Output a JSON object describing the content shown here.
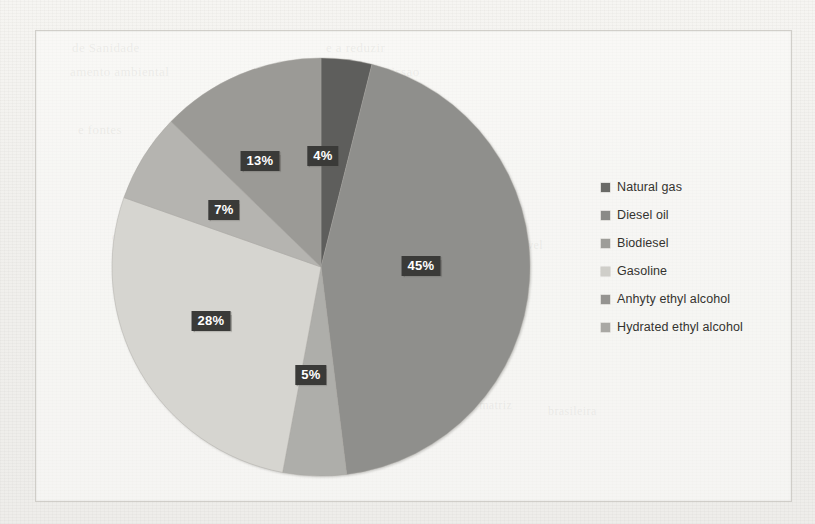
{
  "chart_data": {
    "type": "pie",
    "title": "",
    "categories": [
      "Natural gas",
      "Diesel oil",
      "Anhydrous ethyl alcohol",
      "Gasoline",
      "Biodiesel",
      "Hydrated ethyl alcohol"
    ],
    "values": [
      4,
      45,
      5,
      28,
      7,
      13
    ],
    "value_labels": [
      "4%",
      "45%",
      "5%",
      "28%",
      "7%",
      "13%"
    ],
    "units": "percent",
    "legend_position": "right",
    "start_angle_deg": 0,
    "direction": "clockwise",
    "grid": false,
    "slices": [
      {
        "label": "Natural gas",
        "value": 4,
        "display": "4%",
        "color": "#5e5e5c",
        "order_clockwise": 1
      },
      {
        "label": "Diesel oil",
        "value": 45,
        "display": "45%",
        "color": "#8f8f8c",
        "order_clockwise": 2
      },
      {
        "label": "Anhydrous ethyl alcohol",
        "value": 5,
        "display": "5%",
        "color": "#aeaeaa",
        "order_clockwise": 3
      },
      {
        "label": "Gasoline",
        "value": 28,
        "display": "28%",
        "color": "#d6d5d0",
        "order_clockwise": 4
      },
      {
        "label": "Biodiesel",
        "value": 7,
        "display": "7%",
        "color": "#b5b4b0",
        "order_clockwise": 5
      },
      {
        "label": "Hydrated ethyl alcohol",
        "value": 13,
        "display": "13%",
        "color": "#9b9a96",
        "order_clockwise": 6
      }
    ]
  },
  "legend": {
    "items": [
      {
        "label": "Natural gas",
        "color": "#6a6a67"
      },
      {
        "label": "Diesel oil",
        "color": "#8a8a87"
      },
      {
        "label": "Biodiesel",
        "color": "#9e9d99"
      },
      {
        "label": "Gasoline",
        "color": "#cfcec9"
      },
      {
        "label": "Anhyty ethyl alcohol",
        "color": "#959491"
      },
      {
        "label": "Hydrated ethyl alcohol",
        "color": "#a9a8a4"
      }
    ]
  },
  "labels": [
    {
      "text": "4%",
      "x": 322,
      "y": 155
    },
    {
      "text": "13%",
      "x": 259,
      "y": 160
    },
    {
      "text": "45%",
      "x": 420,
      "y": 265
    },
    {
      "text": "7%",
      "x": 223,
      "y": 209
    },
    {
      "text": "28%",
      "x": 210,
      "y": 320
    },
    {
      "text": "5%",
      "x": 310,
      "y": 374
    }
  ],
  "background_ghost_text": [
    {
      "text": "de Sanidade",
      "x": 72,
      "y": 40,
      "size": 13
    },
    {
      "text": "amento ambiental",
      "x": 70,
      "y": 64,
      "size": 13
    },
    {
      "text": "e a reduzir",
      "x": 326,
      "y": 40,
      "size": 13
    },
    {
      "text": "o ambiente a emissao",
      "x": 300,
      "y": 64,
      "size": 13
    },
    {
      "text": "as emissoes de",
      "x": 330,
      "y": 104,
      "size": 13
    },
    {
      "text": "e fontes",
      "x": 78,
      "y": 122,
      "size": 13
    },
    {
      "text": "a  Brasil",
      "x": 300,
      "y": 130,
      "size": 13
    },
    {
      "text": "de queima",
      "x": 112,
      "y": 230,
      "size": 12
    },
    {
      "text": "combustivel",
      "x": 480,
      "y": 238,
      "size": 12
    },
    {
      "text": "produzido",
      "x": 120,
      "y": 262,
      "size": 12
    },
    {
      "text": "a matriz",
      "x": 470,
      "y": 398,
      "size": 12
    },
    {
      "text": "Figura 2",
      "x": 330,
      "y": 432,
      "size": 13
    },
    {
      "text": "brasileira",
      "x": 548,
      "y": 404,
      "size": 12
    }
  ]
}
